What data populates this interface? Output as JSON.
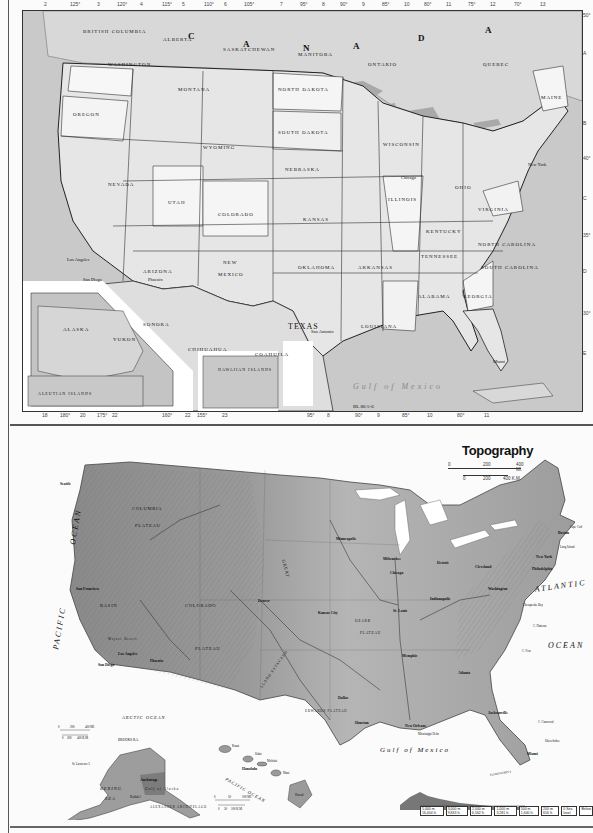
{
  "political_map": {
    "code": "RL 86-5-6",
    "country_labels": [
      "C",
      "A",
      "N",
      "A",
      "D",
      "A"
    ],
    "states": [
      {
        "name": "WASHINGTON",
        "x": 85,
        "y": 55
      },
      {
        "name": "OREGON",
        "x": 65,
        "y": 105
      },
      {
        "name": "MONTANA",
        "x": 180,
        "y": 80
      },
      {
        "name": "NORTH DAKOTA",
        "x": 272,
        "y": 80
      },
      {
        "name": "SOUTH DAKOTA",
        "x": 275,
        "y": 123
      },
      {
        "name": "WYOMING",
        "x": 190,
        "y": 138
      },
      {
        "name": "NEBRASKA",
        "x": 285,
        "y": 160
      },
      {
        "name": "NEVADA",
        "x": 100,
        "y": 175
      },
      {
        "name": "UTAH",
        "x": 160,
        "y": 193
      },
      {
        "name": "COLORADO",
        "x": 215,
        "y": 205
      },
      {
        "name": "KANSAS",
        "x": 300,
        "y": 210
      },
      {
        "name": "ARIZONA",
        "x": 140,
        "y": 262
      },
      {
        "name": "NEW",
        "x": 210,
        "y": 258
      },
      {
        "name": "MEXICO",
        "x": 210,
        "y": 270
      },
      {
        "name": "OKLAHOMA",
        "x": 300,
        "y": 258
      },
      {
        "name": "TEXAS",
        "x": 285,
        "y": 310
      },
      {
        "name": "WISCONSIN",
        "x": 385,
        "y": 135
      },
      {
        "name": "ILLINOIS",
        "x": 380,
        "y": 190
      },
      {
        "name": "KENTUCKY",
        "x": 425,
        "y": 222
      },
      {
        "name": "TENNESSEE",
        "x": 420,
        "y": 245
      },
      {
        "name": "ARKANSAS",
        "x": 355,
        "y": 258
      },
      {
        "name": "ALABAMA",
        "x": 410,
        "y": 285
      },
      {
        "name": "GEORGIA",
        "x": 450,
        "y": 285
      },
      {
        "name": "LOUISIANA",
        "x": 355,
        "y": 317
      },
      {
        "name": "VIRGINIA",
        "x": 470,
        "y": 200
      },
      {
        "name": "NORTH CAROLINA",
        "x": 480,
        "y": 235
      },
      {
        "name": "SOUTH CAROLINA",
        "x": 475,
        "y": 260
      },
      {
        "name": "OHIO",
        "x": 440,
        "y": 178
      },
      {
        "name": "MAINE",
        "x": 545,
        "y": 90
      },
      {
        "name": "QUEBEC",
        "x": 470,
        "y": 55
      },
      {
        "name": "ONTARIO",
        "x": 360,
        "y": 55
      },
      {
        "name": "BRITISH COLUMBIA",
        "x": 60,
        "y": 22
      },
      {
        "name": "ALBERTA",
        "x": 150,
        "y": 30
      },
      {
        "name": "SASKATCHEWAN",
        "x": 215,
        "y": 40
      },
      {
        "name": "MANITOBA",
        "x": 290,
        "y": 44
      }
    ],
    "mexico_labels": [
      "SONORA",
      "CHIHUAHUA",
      "COAHUILA"
    ],
    "water_labels": [
      "Gulf of Mexico"
    ],
    "cities": [
      "Los Angeles",
      "San Diego",
      "Chicago",
      "New York",
      "Miami",
      "San Antonio",
      "Phoenix"
    ],
    "insets": {
      "alaska": {
        "labels": [
          "ALASKA",
          "YUKON",
          "ALEUTIAN ISLANDS"
        ]
      },
      "hawaii": {
        "labels": [
          "HAWAIIAN ISLANDS"
        ]
      }
    },
    "top_ticks": [
      "2",
      "125°",
      "3",
      "120°",
      "4",
      "115°",
      "5",
      "110°",
      "6",
      "105°",
      "7",
      "95°",
      "8",
      "90°",
      "9",
      "85°",
      "10",
      "80°",
      "11",
      "75°",
      "12",
      "70°",
      "13"
    ],
    "bottom_ticks": [
      "18",
      "180°",
      "20",
      "175°",
      "22",
      "160°",
      "22",
      "155°",
      "23",
      "",
      "7",
      "95°",
      "8",
      "90°",
      "9",
      "85°",
      "10",
      "80°",
      "11"
    ],
    "right_ticks": [
      "50°",
      "A",
      "B",
      "40°",
      "C",
      "35°",
      "D",
      "30°",
      "E",
      "25°",
      "F"
    ]
  },
  "topography_map": {
    "title": "Topography",
    "scale": {
      "mi": [
        "0",
        "200",
        "400 MI."
      ],
      "km": [
        "0",
        "200",
        "400 K.M."
      ]
    },
    "oceans": {
      "pacific_1": "PACIFIC",
      "pacific_2": "OCEAN",
      "atlantic_1": "ATLANTIC",
      "atlantic_2": "OCEAN",
      "gulf": "Gulf of Mexico",
      "arctic": "ARCTIC OCEAN",
      "bering": "BERING",
      "sea": "SEA",
      "gulf_alaska": "Gulf of Alaska",
      "pacific_hawaii": "PACIFIC OCEAN"
    },
    "features": [
      {
        "name": "COLUMBIA",
        "x": 140,
        "y": 510
      },
      {
        "name": "PLATEAU",
        "x": 148,
        "y": 527
      },
      {
        "name": "GREAT",
        "x": 260,
        "y": 560
      },
      {
        "name": "BASIN",
        "x": 110,
        "y": 607
      },
      {
        "name": "COLORADO",
        "x": 205,
        "y": 607
      },
      {
        "name": "PLATEAU",
        "x": 210,
        "y": 650
      },
      {
        "name": "OZARK",
        "x": 360,
        "y": 622
      },
      {
        "name": "PLATEAU",
        "x": 370,
        "y": 634
      },
      {
        "name": "LLANO ESTACADO",
        "x": 268,
        "y": 670
      },
      {
        "name": "EDWARDS PLATEAU",
        "x": 318,
        "y": 712
      },
      {
        "name": "Mojave Desert",
        "x": 120,
        "y": 640
      },
      {
        "name": "ALEXANDER ARCHIPELAGO",
        "x": 160,
        "y": 804
      }
    ],
    "cities": [
      {
        "name": "San Francisco",
        "x": 76,
        "y": 590
      },
      {
        "name": "Los Angeles",
        "x": 122,
        "y": 655
      },
      {
        "name": "San Diego",
        "x": 100,
        "y": 664
      },
      {
        "name": "Phoenix",
        "x": 155,
        "y": 660
      },
      {
        "name": "Denver",
        "x": 262,
        "y": 601
      },
      {
        "name": "Kansas City",
        "x": 320,
        "y": 612
      },
      {
        "name": "St. Louis",
        "x": 395,
        "y": 610
      },
      {
        "name": "Minneapolis",
        "x": 340,
        "y": 538
      },
      {
        "name": "Milwaukee",
        "x": 380,
        "y": 558
      },
      {
        "name": "Chicago",
        "x": 390,
        "y": 572
      },
      {
        "name": "Detroit",
        "x": 437,
        "y": 562
      },
      {
        "name": "Cleveland",
        "x": 475,
        "y": 566
      },
      {
        "name": "Indianapolis",
        "x": 430,
        "y": 598
      },
      {
        "name": "Washington",
        "x": 490,
        "y": 588
      },
      {
        "name": "Philadelphia",
        "x": 545,
        "y": 566
      },
      {
        "name": "New York",
        "x": 552,
        "y": 555
      },
      {
        "name": "Boston",
        "x": 565,
        "y": 533
      },
      {
        "name": "Memphis",
        "x": 405,
        "y": 655
      },
      {
        "name": "Atlanta",
        "x": 460,
        "y": 672
      },
      {
        "name": "Dallas",
        "x": 340,
        "y": 697
      },
      {
        "name": "Houston",
        "x": 360,
        "y": 722
      },
      {
        "name": "New Orleans",
        "x": 410,
        "y": 725
      },
      {
        "name": "Jacksonville",
        "x": 490,
        "y": 712
      },
      {
        "name": "Miami",
        "x": 528,
        "y": 752
      },
      {
        "name": "Seattle",
        "x": 62,
        "y": 483
      },
      {
        "name": "Anchorage",
        "x": 90,
        "y": 780
      },
      {
        "name": "Honolulu",
        "x": 245,
        "y": 768
      }
    ],
    "alaska_scale": {
      "mi": [
        "0",
        "200",
        "400 MI."
      ],
      "km": [
        "0",
        "200",
        "400 K.M."
      ]
    },
    "hawaii_scale": {
      "mi": [
        "0",
        "50",
        "100 MI."
      ],
      "km": [
        "0",
        "50",
        "100 K.M."
      ]
    },
    "hawaii_islands": [
      "Kauai",
      "Oahu",
      "Molokai",
      "Maui",
      "Hawaii"
    ],
    "places_misc": [
      "Long Island",
      "Cape Cod",
      "Chesapeake Bay",
      "C. Hatteras",
      "C. Fear",
      "C. Canaveral",
      "Okeechobee",
      "FLORIDA KEYS",
      "Mississippi Delta",
      "St. Lawrence I.",
      "Kodiak I.",
      "BROOKS RA."
    ],
    "elevation_legend": [
      "5,000 m 16,404 ft.",
      "3,000 m 9,843 ft.",
      "2,000 m 6,562 ft.",
      "1,000 m 3,281 ft.",
      "500 m 1,640 ft.",
      "200 m 656 ft.",
      "0 Sea level",
      "Below"
    ]
  }
}
